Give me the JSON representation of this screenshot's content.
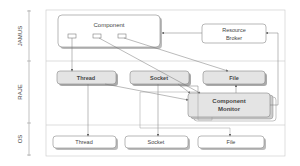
{
  "diagram": {
    "layers": [
      {
        "id": "jamus",
        "label": "JAMUS"
      },
      {
        "id": "raje",
        "label": "RAJE"
      },
      {
        "id": "os",
        "label": "OS"
      }
    ],
    "jamus": {
      "component": "Component",
      "resource_broker_line1": "Resource",
      "resource_broker_line2": "Broker"
    },
    "raje": {
      "thread": "Thread",
      "socket": "Socket",
      "file": "File",
      "monitor_line1": "Component",
      "monitor_line2": "Monitor"
    },
    "os": {
      "thread": "Thread",
      "socket": "Socket",
      "file": "File"
    },
    "colors": {
      "box_fill_raje": "#e4e4e4",
      "box_fill_white": "#ffffff",
      "line": "#777777",
      "layer_border": "#bbbbbb"
    }
  }
}
